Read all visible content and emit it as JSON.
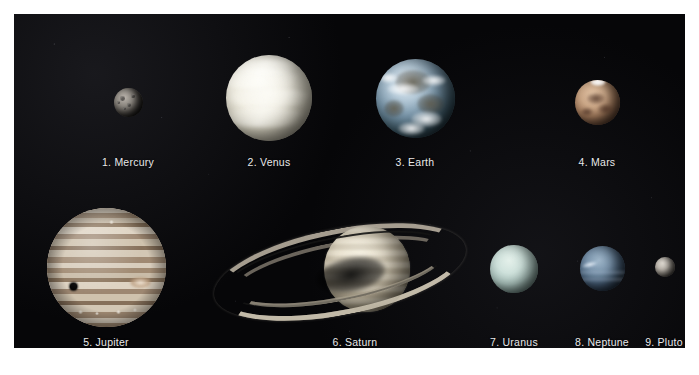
{
  "figure": {
    "background_color": "#ffffff",
    "panel_color": "#060608",
    "label_color": "#e9e9ea"
  },
  "planets": [
    {
      "index": "1",
      "name": "Mercury",
      "label": "1. Mercury",
      "row": "top",
      "color": "#8d8881",
      "appearance": "small gray heavily cratered sphere, partially shadowed"
    },
    {
      "index": "2",
      "name": "Venus",
      "label": "2. Venus",
      "row": "top",
      "color": "#f2efe3",
      "appearance": "large bright pale-yellow-white cloud-covered sphere with swirled bands"
    },
    {
      "index": "3",
      "name": "Earth",
      "label": "3. Earth",
      "row": "top",
      "color": "#7a97ab",
      "appearance": "blue-white marbled globe with swirling clouds and dark land masses"
    },
    {
      "index": "4",
      "name": "Mars",
      "label": "4. Mars",
      "row": "top",
      "color": "#cca888",
      "appearance": "reddish-tan sphere with dark surface markings and white polar ice cap"
    },
    {
      "index": "5",
      "name": "Jupiter",
      "label": "5. Jupiter",
      "row": "bottom",
      "color": "#c9bca8",
      "appearance": "largest planet, strong horizontal cloud bands, Great Red Spot and a dark moon shadow"
    },
    {
      "index": "6",
      "name": "Saturn",
      "label": "6. Saturn",
      "row": "bottom",
      "color": "#e8e0cc",
      "appearance": "pale gold globe encircled by a wide tilted ring system with a visible division gap"
    },
    {
      "index": "7",
      "name": "Uranus",
      "label": "7. Uranus",
      "row": "bottom",
      "color": "#cfe2dc",
      "appearance": "featureless pale cyan-green sphere"
    },
    {
      "index": "8",
      "name": "Neptune",
      "label": "8. Neptune",
      "row": "bottom",
      "color": "#516b86",
      "appearance": "deep blue sphere with a bright cloud streak and faint banding"
    },
    {
      "index": "9",
      "name": "Pluto",
      "label": "9. Pluto",
      "row": "bottom",
      "color": "#bdb7ae",
      "appearance": "very small dim gray sphere"
    }
  ]
}
